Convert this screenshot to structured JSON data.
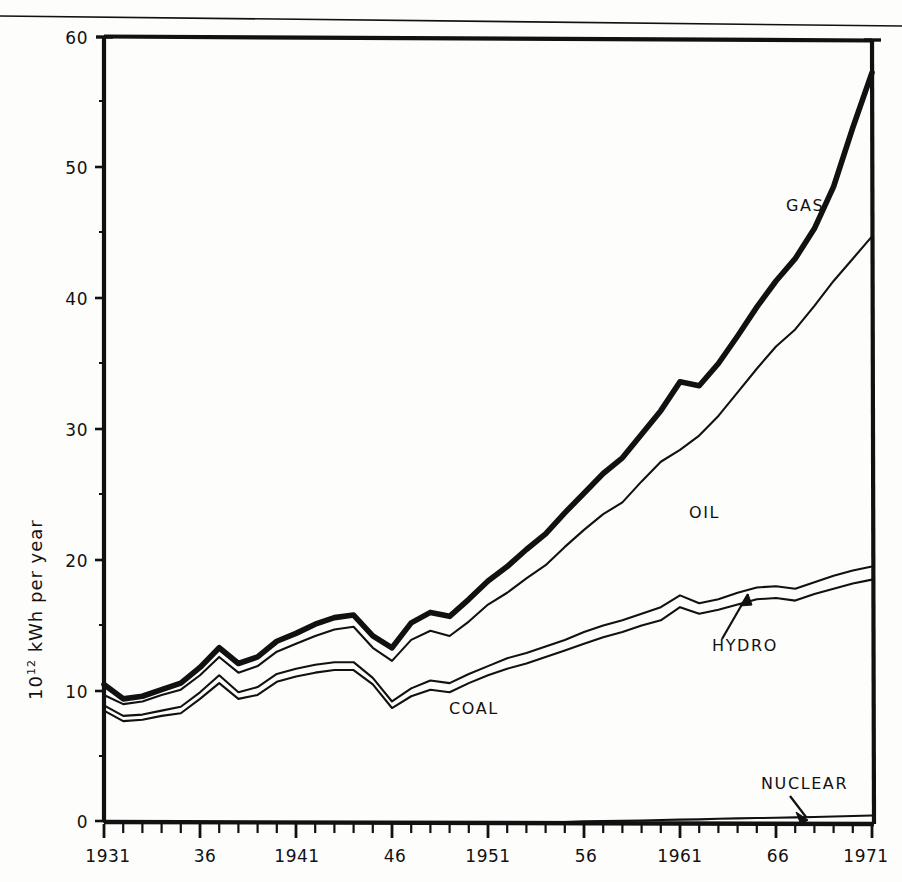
{
  "figure": {
    "page_rule": "top-horizontal-rule",
    "background": "#fdfdfc",
    "ink": "#111111"
  },
  "axes": {
    "y_title_main": "kWh per year",
    "y_title_prefix": "10",
    "y_title_exponent": "12",
    "y_ticks": [
      "0",
      "10",
      "20",
      "30",
      "40",
      "50",
      "60"
    ],
    "x_ticks": [
      "1931",
      "36",
      "1941",
      "46",
      "1951",
      "56",
      "1961",
      "66",
      "1971"
    ]
  },
  "labels": {
    "gas": "GAS",
    "oil": "OIL",
    "hydro": "HYDRO",
    "coal": "COAL",
    "nuclear": "NUCLEAR"
  },
  "chart_data": {
    "type": "area",
    "title": "",
    "subtitle": "",
    "xlabel": "",
    "ylabel": "10^12 kWh per year",
    "xlim": [
      1931,
      1971
    ],
    "ylim": [
      0,
      60
    ],
    "grid": false,
    "legend": "inline-annotations",
    "stacked": true,
    "stack_order": [
      "NUCLEAR",
      "COAL",
      "HYDRO",
      "OIL",
      "GAS"
    ],
    "note": "Cumulative stacked boundary lines. Thick outer line is the total (top of GAS band).",
    "x": [
      1931,
      1932,
      1933,
      1934,
      1935,
      1936,
      1937,
      1938,
      1939,
      1940,
      1941,
      1942,
      1943,
      1944,
      1945,
      1946,
      1947,
      1948,
      1949,
      1950,
      1951,
      1952,
      1953,
      1954,
      1955,
      1956,
      1957,
      1958,
      1959,
      1960,
      1961,
      1962,
      1963,
      1964,
      1965,
      1966,
      1967,
      1968,
      1969,
      1970,
      1971
    ],
    "series": [
      {
        "name": "NUCLEAR",
        "role": "cumulative_boundary_1",
        "values": [
          0,
          0,
          0,
          0,
          0,
          0,
          0,
          0,
          0,
          0,
          0,
          0,
          0,
          0,
          0,
          0,
          0,
          0,
          0,
          0,
          0,
          0,
          0,
          0,
          0,
          0.05,
          0.08,
          0.1,
          0.12,
          0.15,
          0.18,
          0.2,
          0.25,
          0.28,
          0.3,
          0.32,
          0.35,
          0.38,
          0.42,
          0.46,
          0.5
        ]
      },
      {
        "name": "COAL",
        "role": "cumulative_boundary_2",
        "values": [
          8.5,
          7.7,
          7.8,
          8.1,
          8.3,
          9.4,
          10.6,
          9.4,
          9.7,
          10.7,
          11.1,
          11.4,
          11.6,
          11.6,
          10.5,
          8.7,
          9.6,
          10.1,
          9.9,
          10.6,
          11.2,
          11.7,
          12.1,
          12.6,
          13.1,
          13.6,
          14.1,
          14.5,
          15.0,
          15.4,
          16.4,
          15.9,
          16.2,
          16.6,
          17.0,
          17.1,
          16.9,
          17.4,
          17.8,
          18.2,
          18.5
        ]
      },
      {
        "name": "HYDRO",
        "role": "cumulative_boundary_3",
        "values": [
          8.9,
          8.1,
          8.2,
          8.5,
          8.8,
          9.9,
          11.2,
          9.9,
          10.3,
          11.3,
          11.7,
          12.0,
          12.2,
          12.2,
          11.0,
          9.2,
          10.2,
          10.8,
          10.6,
          11.3,
          11.9,
          12.5,
          12.9,
          13.4,
          13.9,
          14.5,
          15.0,
          15.4,
          15.9,
          16.4,
          17.3,
          16.7,
          17.0,
          17.5,
          17.9,
          18.0,
          17.8,
          18.3,
          18.8,
          19.2,
          19.5
        ]
      },
      {
        "name": "OIL",
        "role": "cumulative_boundary_4",
        "values": [
          9.7,
          9.0,
          9.2,
          9.7,
          10.1,
          11.2,
          12.6,
          11.4,
          11.9,
          13.0,
          13.6,
          14.2,
          14.7,
          14.9,
          13.3,
          12.3,
          13.9,
          14.6,
          14.2,
          15.3,
          16.6,
          17.5,
          18.6,
          19.6,
          21.0,
          22.3,
          23.5,
          24.4,
          26.0,
          27.5,
          28.4,
          29.5,
          31.0,
          32.8,
          34.6,
          36.3,
          37.6,
          39.4,
          41.3,
          43.0,
          44.7
        ]
      },
      {
        "name": "GAS",
        "role": "total_thick_line",
        "values": [
          10.5,
          9.4,
          9.6,
          10.1,
          10.6,
          11.8,
          13.3,
          12.1,
          12.6,
          13.8,
          14.4,
          15.1,
          15.6,
          15.8,
          14.2,
          13.3,
          15.2,
          16.0,
          15.7,
          17.0,
          18.4,
          19.5,
          20.8,
          22.0,
          23.6,
          25.1,
          26.6,
          27.8,
          29.6,
          31.4,
          33.6,
          33.3,
          35.0,
          37.1,
          39.3,
          41.3,
          43.0,
          45.3,
          48.5,
          53.0,
          57.2
        ]
      }
    ],
    "annotations": [
      {
        "text": "GAS",
        "x": 1968.5,
        "y": 48.0,
        "kind": "band-label"
      },
      {
        "text": "OIL",
        "x": 1962.5,
        "y": 23.5,
        "kind": "band-label"
      },
      {
        "text": "HYDRO",
        "x": 1964.5,
        "y": 13.0,
        "kind": "leader-label",
        "points_to": {
          "x": 1966.0,
          "y": 17.8
        }
      },
      {
        "text": "COAL",
        "x": 1949.0,
        "y": 7.5,
        "kind": "band-label"
      },
      {
        "text": "NUCLEAR",
        "x": 1968.0,
        "y": 3.2,
        "kind": "leader-label",
        "points_to": {
          "x": 1967.0,
          "y": 0.45
        }
      }
    ]
  }
}
